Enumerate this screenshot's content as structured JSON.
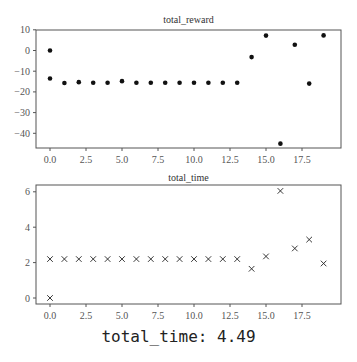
{
  "chart_data": [
    {
      "type": "scatter",
      "title": "total_reward",
      "xlabel": "",
      "ylabel": "",
      "marker": "dot",
      "xlim": [
        -1,
        20
      ],
      "ylim": [
        -46,
        10
      ],
      "x_ticks": [
        0.0,
        2.5,
        5.0,
        7.5,
        10.0,
        12.5,
        15.0,
        17.5
      ],
      "x_tick_labels": [
        "0.0",
        "2.5",
        "5.0",
        "7.5",
        "10.0",
        "12.5",
        "15.0",
        "17.5"
      ],
      "y_ticks": [
        10,
        0,
        -10,
        -20,
        -30,
        -40
      ],
      "y_tick_labels": [
        "10",
        "0",
        "-10",
        "-20",
        "-30",
        "-40"
      ],
      "grid": false,
      "points": [
        {
          "x": 0,
          "y": 0
        },
        {
          "x": 0,
          "y": -13.5
        },
        {
          "x": 1,
          "y": -15.7
        },
        {
          "x": 2,
          "y": -15.3
        },
        {
          "x": 3,
          "y": -15.6
        },
        {
          "x": 4,
          "y": -15.6
        },
        {
          "x": 5,
          "y": -14.8
        },
        {
          "x": 6,
          "y": -15.6
        },
        {
          "x": 7,
          "y": -15.6
        },
        {
          "x": 8,
          "y": -15.6
        },
        {
          "x": 9,
          "y": -15.6
        },
        {
          "x": 10,
          "y": -15.6
        },
        {
          "x": 11,
          "y": -15.6
        },
        {
          "x": 12,
          "y": -15.6
        },
        {
          "x": 13,
          "y": -15.6
        },
        {
          "x": 14,
          "y": -3.2
        },
        {
          "x": 15,
          "y": 7.2
        },
        {
          "x": 16,
          "y": -45.0
        },
        {
          "x": 17,
          "y": 2.8
        },
        {
          "x": 18,
          "y": -16.0
        },
        {
          "x": 19,
          "y": 7.3
        }
      ]
    },
    {
      "type": "scatter",
      "title": "total_time",
      "xlabel": "",
      "ylabel": "",
      "marker": "x",
      "xlim": [
        -1,
        20
      ],
      "ylim": [
        -0.3,
        6.4
      ],
      "x_ticks": [
        0.0,
        2.5,
        5.0,
        7.5,
        10.0,
        12.5,
        15.0,
        17.5
      ],
      "x_tick_labels": [
        "0.0",
        "2.5",
        "5.0",
        "7.5",
        "10.0",
        "12.5",
        "15.0",
        "17.5"
      ],
      "y_ticks": [
        6,
        4,
        2,
        0
      ],
      "y_tick_labels": [
        "6",
        "4",
        "2",
        "0"
      ],
      "grid": false,
      "points": [
        {
          "x": 0,
          "y": 0.0
        },
        {
          "x": 0,
          "y": 2.2
        },
        {
          "x": 1,
          "y": 2.2
        },
        {
          "x": 2,
          "y": 2.2
        },
        {
          "x": 3,
          "y": 2.2
        },
        {
          "x": 4,
          "y": 2.2
        },
        {
          "x": 5,
          "y": 2.2
        },
        {
          "x": 6,
          "y": 2.2
        },
        {
          "x": 7,
          "y": 2.2
        },
        {
          "x": 8,
          "y": 2.2
        },
        {
          "x": 9,
          "y": 2.2
        },
        {
          "x": 10,
          "y": 2.2
        },
        {
          "x": 11,
          "y": 2.2
        },
        {
          "x": 12,
          "y": 2.2
        },
        {
          "x": 13,
          "y": 2.2
        },
        {
          "x": 14,
          "y": 1.65
        },
        {
          "x": 15,
          "y": 2.35
        },
        {
          "x": 16,
          "y": 6.05
        },
        {
          "x": 17,
          "y": 2.8
        },
        {
          "x": 18,
          "y": 3.3
        },
        {
          "x": 19,
          "y": 1.95
        }
      ]
    }
  ],
  "caption": "total_time: 4.49"
}
